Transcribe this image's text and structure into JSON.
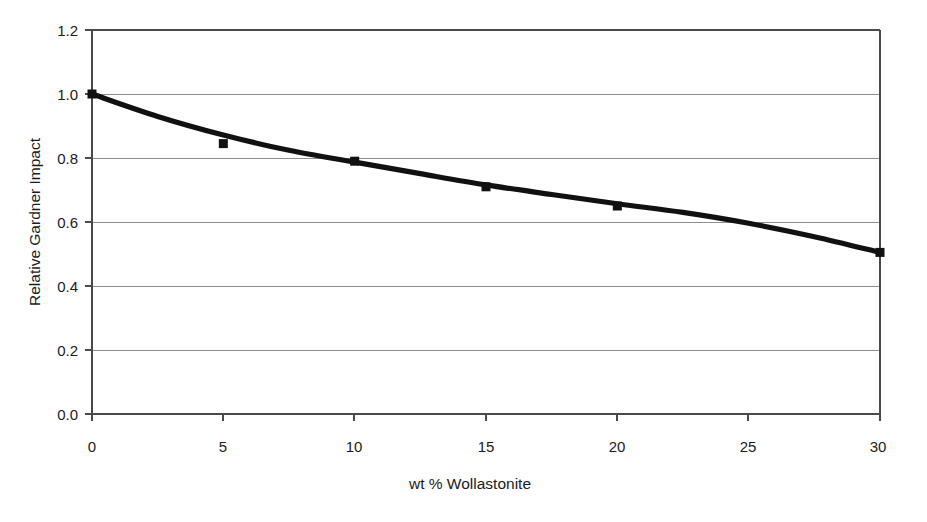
{
  "chart_data": {
    "type": "line",
    "title": "",
    "xlabel": "wt % Wollastonite",
    "ylabel": "Relative Gardner Impact",
    "xlim": [
      0,
      30
    ],
    "ylim": [
      0.0,
      1.2
    ],
    "xticks": [
      "0",
      "5",
      "10",
      "15",
      "20",
      "25",
      "30"
    ],
    "yticks": [
      "0.0",
      "0.2",
      "0.4",
      "0.6",
      "0.8",
      "1.0",
      "1.2"
    ],
    "grid": "horizontal",
    "legend": "none",
    "series": [
      {
        "name": "Relative Gardner Impact",
        "marker": "filled-square",
        "color": "#111111",
        "x": [
          0,
          5,
          10,
          15,
          20,
          30
        ],
        "values": [
          1.0,
          0.845,
          0.79,
          0.71,
          0.65,
          0.505
        ]
      }
    ],
    "trend_curve": {
      "description": "smooth decreasing curve through the data points with a slight inflection near 22 wt %",
      "x": [
        0,
        2.5,
        5,
        7.5,
        10,
        12.5,
        15,
        17.5,
        20,
        22.5,
        25,
        27.5,
        30
      ],
      "values": [
        1.0,
        0.93,
        0.872,
        0.824,
        0.787,
        0.751,
        0.716,
        0.686,
        0.657,
        0.63,
        0.596,
        0.554,
        0.505
      ]
    }
  },
  "axes": {
    "y_title": "Relative Gardner Impact",
    "x_title": "wt % Wollastonite",
    "y_tick_labels": [
      "1.2",
      "1.0",
      "0.8",
      "0.6",
      "0.4",
      "0.2",
      "0.0"
    ],
    "x_tick_labels": [
      "0",
      "5",
      "10",
      "15",
      "20",
      "25",
      "30"
    ]
  },
  "colors": {
    "curve": "#111111",
    "marker": "#111111",
    "grid": "#8d8d8d",
    "frame": "#4a4a4a",
    "background": "#ffffff",
    "text": "#1b1b1b"
  }
}
